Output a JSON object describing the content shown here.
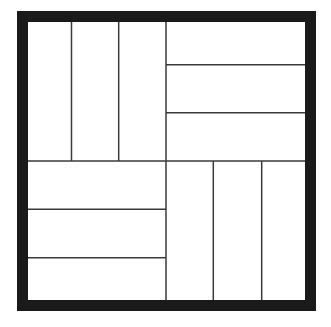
{
  "diagram": {
    "type": "parquet-tiling",
    "colors": {
      "background": "#ffffff",
      "frame": "#1a1a1a",
      "lines": "#3a3a3a"
    },
    "frame": {
      "x": 22.5,
      "y": 16.5,
      "width": 288,
      "height": 289,
      "stroke_width": 11
    },
    "center": {
      "x": 166,
      "y": 161
    },
    "quadrants": [
      {
        "name": "top-left",
        "orientation": "vertical",
        "strips": 3,
        "dividers": [
          71.5,
          118.7
        ]
      },
      {
        "name": "top-right",
        "orientation": "horizontal",
        "strips": 3,
        "dividers": [
          64.7,
          112.7
        ]
      },
      {
        "name": "bottom-left",
        "orientation": "horizontal",
        "strips": 3,
        "dividers": [
          209.3,
          257.7
        ]
      },
      {
        "name": "bottom-right",
        "orientation": "vertical",
        "strips": 3,
        "dividers": [
          213.3,
          261.7
        ]
      }
    ]
  }
}
